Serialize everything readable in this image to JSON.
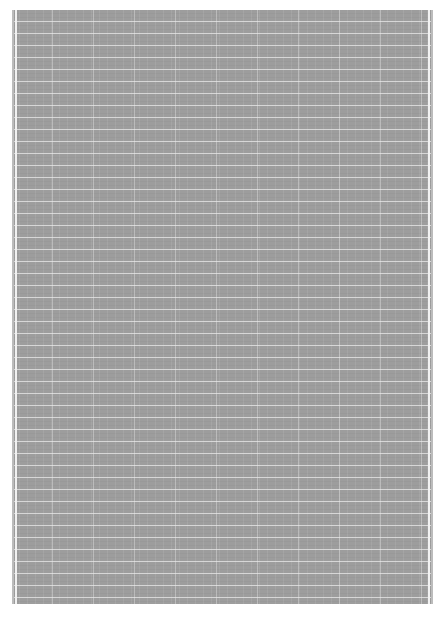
{
  "document": {
    "type": "grid-paper",
    "background_color": "#9d9d9d",
    "grid_line_color": "#ebebeb",
    "text": ""
  }
}
